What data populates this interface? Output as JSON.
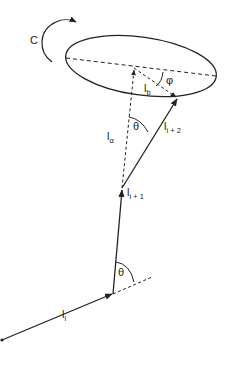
{
  "diagram": {
    "rotation_label": "C",
    "theta_top": "θ",
    "theta_bottom": "θ",
    "phi": "φ",
    "vectors": {
      "l_i": {
        "base": "l",
        "sub": "i"
      },
      "l_i1": {
        "base": "l",
        "sub": "i + 1"
      },
      "l_i2": {
        "base": "l",
        "sub": "i + 2"
      },
      "l_a": {
        "base": "l",
        "sub": "α"
      },
      "l_b": {
        "base": "l",
        "sub": "b"
      }
    },
    "colors": {
      "line": "#222222",
      "background": "#ffffff"
    }
  }
}
